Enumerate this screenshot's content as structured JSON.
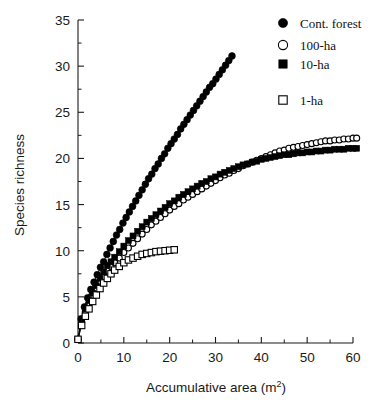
{
  "chart_data": {
    "type": "scatter",
    "title": "",
    "xlabel": "Accumulative area (m2)",
    "xlabel_base": "Accumulative area (m",
    "xlabel_sup": "2",
    "xlabel_tail": ")",
    "ylabel": "Species richness",
    "xlim": [
      0,
      60
    ],
    "ylim": [
      0,
      35
    ],
    "xticks": [
      0,
      10,
      20,
      30,
      40,
      50,
      60
    ],
    "yticks": [
      0,
      5,
      10,
      15,
      20,
      25,
      30,
      35
    ],
    "xtick_labels": [
      "0",
      "10",
      "20",
      "30",
      "40",
      "50",
      "60"
    ],
    "ytick_labels": [
      "0",
      "5",
      "10",
      "15",
      "20",
      "25",
      "30",
      "35"
    ],
    "x_minor_step": 5,
    "y_minor_step": 2.5,
    "grid": false,
    "legend_position": "top-right",
    "marker_color": "#000000",
    "line_color": "#000000",
    "series": [
      {
        "name": "Cont. forest",
        "marker": "filled-circle",
        "x": [
          0,
          0.7,
          1.4,
          2.1,
          2.8,
          3.5,
          4.2,
          4.9,
          5.6,
          6.3,
          7.0,
          7.7,
          8.4,
          9.1,
          9.8,
          10.5,
          11.2,
          11.9,
          12.6,
          13.3,
          14.0,
          14.7,
          15.4,
          16.1,
          16.8,
          17.5,
          18.2,
          18.9,
          19.6,
          20.3,
          21.0,
          21.7,
          22.4,
          23.1,
          23.8,
          24.5,
          25.2,
          25.9,
          26.6,
          27.3,
          28.0,
          28.7,
          29.4,
          30.1,
          30.8,
          31.5,
          32.2,
          32.9,
          33.6
        ],
        "y": [
          0.4,
          2.6,
          3.9,
          4.9,
          5.8,
          6.6,
          7.4,
          8.2,
          8.8,
          9.6,
          10.3,
          11.0,
          11.7,
          12.3,
          13.0,
          13.6,
          14.2,
          14.8,
          15.4,
          16.0,
          16.6,
          17.2,
          17.8,
          18.3,
          18.9,
          19.4,
          20.0,
          20.5,
          21.1,
          21.6,
          22.1,
          22.6,
          23.2,
          23.7,
          24.2,
          24.7,
          25.2,
          25.7,
          26.2,
          26.7,
          27.2,
          27.7,
          28.1,
          28.6,
          29.1,
          29.6,
          30.1,
          30.6,
          31.1
        ]
      },
      {
        "name": "100-ha",
        "marker": "open-circle",
        "x": [
          0,
          0.8,
          1.6,
          2.4,
          3.2,
          4.0,
          4.8,
          5.6,
          6.4,
          7.2,
          8.0,
          9.0,
          10.0,
          11.0,
          12.0,
          13.0,
          14.0,
          15.0,
          16.0,
          17.0,
          18.0,
          19.0,
          20.0,
          21.0,
          22.0,
          23.0,
          24.0,
          25.0,
          26.0,
          27.0,
          28.0,
          29.0,
          30.0,
          31.0,
          32.0,
          33.0,
          34.0,
          35.0,
          36.0,
          37.0,
          38.0,
          39.0,
          40.0,
          41.0,
          42.0,
          43.0,
          44.0,
          45.0,
          46.0,
          47.0,
          48.0,
          49.0,
          50.0,
          51.0,
          52.0,
          53.0,
          54.0,
          55.0,
          56.0,
          57.0,
          58.0,
          59.0,
          60.0,
          60.8
        ],
        "y": [
          0.4,
          2.3,
          3.4,
          4.3,
          5.1,
          5.9,
          6.6,
          7.2,
          7.8,
          8.3,
          8.7,
          9.2,
          9.8,
          10.3,
          10.8,
          11.3,
          11.8,
          12.3,
          12.8,
          13.2,
          13.6,
          14.0,
          14.4,
          14.8,
          15.1,
          15.5,
          15.8,
          16.1,
          16.4,
          16.7,
          17.0,
          17.3,
          17.6,
          17.9,
          18.2,
          18.4,
          18.7,
          18.9,
          19.2,
          19.4,
          19.6,
          19.8,
          20.0,
          20.2,
          20.4,
          20.6,
          20.8,
          20.9,
          21.1,
          21.2,
          21.3,
          21.4,
          21.5,
          21.6,
          21.7,
          21.8,
          21.9,
          21.9,
          22.0,
          22.0,
          22.1,
          22.1,
          22.2,
          22.2
        ]
      },
      {
        "name": "10-ha",
        "marker": "filled-square",
        "x": [
          0,
          0.8,
          1.6,
          2.4,
          3.2,
          4.0,
          4.8,
          5.6,
          6.4,
          7.2,
          8.0,
          9.0,
          10.0,
          11.0,
          12.0,
          13.0,
          14.0,
          15.0,
          16.0,
          17.0,
          18.0,
          19.0,
          20.0,
          21.0,
          22.0,
          23.0,
          24.0,
          25.0,
          26.0,
          27.0,
          28.0,
          29.0,
          30.0,
          31.0,
          32.0,
          33.0,
          34.0,
          35.0,
          36.0,
          37.0,
          38.0,
          39.0,
          40.0,
          41.0,
          42.0,
          43.0,
          44.0,
          45.0,
          46.0,
          47.0,
          48.0,
          49.0,
          50.0,
          51.0,
          52.0,
          53.0,
          54.0,
          55.0,
          56.0,
          57.0,
          58.0,
          59.0,
          60.0,
          60.8
        ],
        "y": [
          0.4,
          2.6,
          3.7,
          4.6,
          5.4,
          6.2,
          7.0,
          7.7,
          8.4,
          8.8,
          9.3,
          9.9,
          10.5,
          11.1,
          11.6,
          12.1,
          12.6,
          13.1,
          13.5,
          13.9,
          14.3,
          14.7,
          15.1,
          15.4,
          15.8,
          16.1,
          16.4,
          16.7,
          17.0,
          17.3,
          17.5,
          17.8,
          18.0,
          18.3,
          18.5,
          18.7,
          18.9,
          19.1,
          19.3,
          19.4,
          19.6,
          19.7,
          19.9,
          20.0,
          20.1,
          20.2,
          20.3,
          20.4,
          20.4,
          20.5,
          20.6,
          20.6,
          20.7,
          20.7,
          20.8,
          20.8,
          20.9,
          20.9,
          21.0,
          21.0,
          21.0,
          21.1,
          21.1,
          21.1
        ]
      },
      {
        "name": "1-ha",
        "marker": "open-square",
        "x": [
          0,
          0.8,
          1.6,
          2.4,
          3.2,
          4.0,
          4.8,
          5.6,
          6.4,
          7.2,
          8.0,
          9.0,
          10.0,
          11.0,
          12.0,
          13.0,
          14.0,
          15.0,
          16.0,
          17.0,
          18.0,
          19.0,
          20.0,
          21.0
        ],
        "y": [
          0.4,
          1.9,
          2.9,
          3.7,
          4.5,
          5.2,
          5.9,
          6.5,
          7.0,
          7.5,
          7.9,
          8.3,
          8.7,
          9.0,
          9.2,
          9.4,
          9.6,
          9.7,
          9.8,
          9.9,
          9.95,
          10.0,
          10.05,
          10.1
        ]
      }
    ]
  },
  "legend": {
    "entries": [
      {
        "label": "Cont. forest",
        "marker": "filled-circle"
      },
      {
        "label": "100-ha",
        "marker": "open-circle"
      },
      {
        "label": "10-ha",
        "marker": "filled-square"
      },
      {
        "label": "1-ha",
        "marker": "open-square"
      }
    ]
  }
}
